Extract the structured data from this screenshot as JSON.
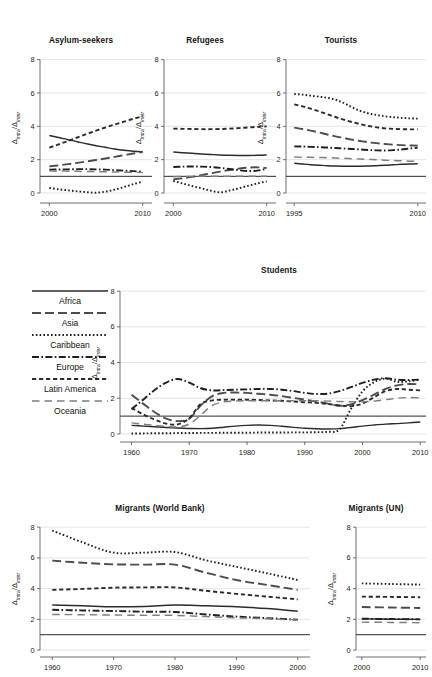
{
  "figure": {
    "yaxis_label_main": "Δ",
    "yaxis_label_sub1": "intra",
    "yaxis_label_div": "/Δ",
    "yaxis_label_sub2": "inter"
  },
  "legend": {
    "title": "",
    "items": [
      {
        "label": "Africa",
        "style": "solid",
        "key": "africa"
      },
      {
        "label": "Asia",
        "style": "longdash",
        "key": "asia"
      },
      {
        "label": "Caribbean",
        "style": "dotted",
        "key": "caribbean"
      },
      {
        "label": "Europe",
        "style": "dashdot",
        "key": "europe"
      },
      {
        "label": "Latin America",
        "style": "shortdash",
        "key": "latin_america"
      },
      {
        "label": "Oceania",
        "style": "dashlong",
        "key": "oceania"
      }
    ]
  },
  "chart_data": [
    {
      "id": "asylum-seekers",
      "type": "line",
      "title": "Asylum-seekers",
      "xlabel": "",
      "ylabel": "Δintra/Δinter",
      "xlim": [
        1999,
        2011
      ],
      "ylim": [
        -0.6,
        8.4
      ],
      "yticks": [
        0,
        2,
        4,
        6,
        8
      ],
      "xticks": [
        2000,
        2010
      ],
      "grid": true,
      "reference_line": 1,
      "x": [
        2000,
        2001,
        2002,
        2003,
        2004,
        2005,
        2006,
        2007,
        2008,
        2009,
        2010
      ],
      "series": [
        {
          "name": "Africa",
          "style": "solid",
          "values": [
            3.45,
            3.33,
            3.2,
            3.08,
            2.95,
            2.84,
            2.74,
            2.64,
            2.56,
            2.5,
            2.47
          ]
        },
        {
          "name": "Asia",
          "style": "longdash",
          "values": [
            1.6,
            1.66,
            1.73,
            1.81,
            1.89,
            1.98,
            2.07,
            2.17,
            2.27,
            2.37,
            2.45
          ]
        },
        {
          "name": "Caribbean",
          "style": "dotted",
          "values": [
            0.3,
            0.22,
            0.16,
            0.1,
            0.05,
            0.02,
            0.08,
            0.2,
            0.36,
            0.53,
            0.68
          ]
        },
        {
          "name": "Europe",
          "style": "dashdot",
          "values": [
            1.4,
            1.41,
            1.42,
            1.43,
            1.43,
            1.42,
            1.4,
            1.37,
            1.34,
            1.31,
            1.28
          ]
        },
        {
          "name": "Latin America",
          "style": "shortdash",
          "values": [
            2.72,
            2.92,
            3.12,
            3.33,
            3.54,
            3.74,
            3.93,
            4.11,
            4.28,
            4.45,
            4.6
          ]
        },
        {
          "name": "Oceania",
          "style": "dashlong",
          "values": [
            1.32,
            1.32,
            1.31,
            1.3,
            1.29,
            1.28,
            1.27,
            1.26,
            1.25,
            1.24,
            1.23
          ]
        }
      ]
    },
    {
      "id": "refugees",
      "type": "line",
      "title": "Refugees",
      "xlabel": "",
      "ylabel": "Δintra/Δinter",
      "xlim": [
        1999,
        2011
      ],
      "ylim": [
        -0.6,
        8.4
      ],
      "yticks": [
        0,
        2,
        4,
        6,
        8
      ],
      "xticks": [
        2000,
        2010
      ],
      "grid": true,
      "reference_line": 1,
      "x": [
        2000,
        2001,
        2002,
        2003,
        2004,
        2005,
        2006,
        2007,
        2008,
        2009,
        2010
      ],
      "series": [
        {
          "name": "Africa",
          "style": "solid",
          "values": [
            2.46,
            2.42,
            2.38,
            2.34,
            2.31,
            2.28,
            2.26,
            2.25,
            2.25,
            2.26,
            2.28
          ]
        },
        {
          "name": "Asia",
          "style": "longdash",
          "values": [
            0.82,
            0.88,
            0.97,
            1.07,
            1.18,
            1.28,
            1.38,
            1.46,
            1.52,
            1.54,
            1.5
          ]
        },
        {
          "name": "Caribbean",
          "style": "dotted",
          "values": [
            0.72,
            0.57,
            0.42,
            0.28,
            0.14,
            0.04,
            0.14,
            0.28,
            0.43,
            0.57,
            0.7
          ]
        },
        {
          "name": "Europe",
          "style": "dashdot",
          "values": [
            1.56,
            1.58,
            1.59,
            1.58,
            1.56,
            1.51,
            1.44,
            1.37,
            1.32,
            1.34,
            1.45
          ]
        },
        {
          "name": "Latin America",
          "style": "shortdash",
          "values": [
            3.86,
            3.85,
            3.84,
            3.83,
            3.83,
            3.84,
            3.86,
            3.89,
            3.93,
            3.97,
            4.0
          ]
        },
        {
          "name": "Oceania",
          "style": "dashlong",
          "values": [
            0.98,
            0.99,
            0.99,
            1.0,
            1.0,
            1.0,
            1.0,
            1.0,
            1.01,
            1.01,
            1.01
          ]
        }
      ]
    },
    {
      "id": "tourists",
      "type": "line",
      "title": "Tourists",
      "xlabel": "",
      "ylabel": "Δintra/Δinter",
      "xlim": [
        1994,
        2011
      ],
      "ylim": [
        -0.6,
        8.4
      ],
      "yticks": [
        0,
        2,
        4,
        6,
        8
      ],
      "xticks": [
        1995,
        2010
      ],
      "grid": true,
      "reference_line": 1,
      "x": [
        1995,
        1996,
        1997,
        1998,
        1999,
        2000,
        2001,
        2002,
        2003,
        2004,
        2005,
        2006,
        2007,
        2008,
        2009,
        2010
      ],
      "series": [
        {
          "name": "Africa",
          "style": "solid",
          "values": [
            1.78,
            1.74,
            1.7,
            1.67,
            1.64,
            1.62,
            1.61,
            1.61,
            1.61,
            1.62,
            1.64,
            1.66,
            1.69,
            1.72,
            1.74,
            1.75
          ]
        },
        {
          "name": "Asia",
          "style": "longdash",
          "values": [
            3.92,
            3.84,
            3.74,
            3.63,
            3.51,
            3.4,
            3.3,
            3.2,
            3.12,
            3.05,
            2.99,
            2.94,
            2.9,
            2.87,
            2.85,
            2.84
          ]
        },
        {
          "name": "Caribbean",
          "style": "dotted",
          "values": [
            5.94,
            5.9,
            5.84,
            5.78,
            5.71,
            5.6,
            5.4,
            5.15,
            4.93,
            4.78,
            4.68,
            4.6,
            4.55,
            4.51,
            4.48,
            4.46
          ]
        },
        {
          "name": "Europe",
          "style": "dashdot",
          "values": [
            2.8,
            2.79,
            2.77,
            2.75,
            2.73,
            2.7,
            2.67,
            2.64,
            2.61,
            2.58,
            2.56,
            2.55,
            2.57,
            2.61,
            2.67,
            2.72
          ]
        },
        {
          "name": "Latin America",
          "style": "shortdash",
          "values": [
            5.32,
            5.2,
            5.06,
            4.9,
            4.73,
            4.56,
            4.4,
            4.26,
            4.13,
            4.02,
            3.94,
            3.88,
            3.85,
            3.83,
            3.82,
            3.82
          ]
        },
        {
          "name": "Oceania",
          "style": "dashlong",
          "values": [
            2.16,
            2.15,
            2.14,
            2.13,
            2.12,
            2.1,
            2.08,
            2.06,
            2.04,
            2.02,
            2.0,
            1.97,
            1.95,
            1.93,
            1.91,
            1.9
          ]
        }
      ]
    },
    {
      "id": "students",
      "type": "line",
      "title": "Students",
      "xlabel": "",
      "ylabel": "Δintra/Δinter",
      "xlim": [
        1958,
        2011
      ],
      "ylim": [
        -0.45,
        8.4
      ],
      "yticks": [
        0,
        2,
        4,
        6,
        8
      ],
      "xticks": [
        1960,
        1970,
        1980,
        1990,
        2000,
        2010
      ],
      "grid": true,
      "reference_line": 1,
      "x": [
        1960,
        1962,
        1964,
        1966,
        1968,
        1970,
        1972,
        1974,
        1976,
        1978,
        1980,
        1982,
        1984,
        1986,
        1988,
        1990,
        1992,
        1994,
        1996,
        1998,
        2000,
        2002,
        2004,
        2006,
        2008,
        2010
      ],
      "series": [
        {
          "name": "Africa",
          "style": "solid",
          "values": [
            0.48,
            0.44,
            0.4,
            0.36,
            0.33,
            0.31,
            0.3,
            0.32,
            0.38,
            0.44,
            0.48,
            0.5,
            0.48,
            0.43,
            0.37,
            0.32,
            0.29,
            0.28,
            0.3,
            0.36,
            0.44,
            0.5,
            0.55,
            0.58,
            0.62,
            0.67
          ]
        },
        {
          "name": "Asia",
          "style": "longdash",
          "values": [
            2.2,
            1.7,
            1.22,
            0.86,
            0.72,
            0.85,
            1.6,
            2.12,
            2.3,
            2.32,
            2.3,
            2.25,
            2.2,
            2.12,
            2.02,
            1.92,
            1.82,
            1.7,
            1.58,
            1.66,
            1.9,
            2.2,
            2.52,
            2.72,
            2.8,
            2.78
          ]
        },
        {
          "name": "Caribbean",
          "style": "dotted",
          "values": [
            0.03,
            0.03,
            0.04,
            0.04,
            0.05,
            0.05,
            0.06,
            0.06,
            0.07,
            0.07,
            0.07,
            0.08,
            0.08,
            0.08,
            0.09,
            0.09,
            0.1,
            0.12,
            0.25,
            1.4,
            2.38,
            2.9,
            3.1,
            2.92,
            2.95,
            3.05
          ]
        },
        {
          "name": "Europe",
          "style": "dashdot",
          "values": [
            1.38,
            1.92,
            2.46,
            2.88,
            3.08,
            2.88,
            2.56,
            2.44,
            2.46,
            2.48,
            2.5,
            2.52,
            2.52,
            2.48,
            2.4,
            2.3,
            2.24,
            2.26,
            2.4,
            2.62,
            2.86,
            3.04,
            3.12,
            3.04,
            3.02,
            3.05
          ]
        },
        {
          "name": "Latin America",
          "style": "shortdash",
          "values": [
            1.46,
            1.1,
            0.8,
            0.58,
            0.54,
            0.88,
            1.68,
            1.88,
            1.92,
            1.92,
            1.92,
            1.9,
            1.88,
            1.86,
            1.82,
            1.78,
            1.74,
            1.68,
            1.6,
            1.56,
            1.7,
            2.06,
            2.4,
            2.52,
            2.48,
            2.44
          ]
        },
        {
          "name": "Oceania",
          "style": "dashlong",
          "values": [
            0.62,
            0.55,
            0.48,
            0.42,
            0.4,
            0.55,
            1.06,
            1.6,
            1.8,
            1.84,
            1.86,
            1.86,
            1.86,
            1.86,
            1.86,
            1.86,
            1.86,
            1.84,
            1.82,
            1.8,
            1.8,
            1.84,
            1.92,
            2.0,
            2.04,
            2.02
          ]
        }
      ]
    },
    {
      "id": "migrants-world-bank",
      "type": "line",
      "title": "Migrants (World Bank)",
      "xlabel": "",
      "ylabel": "Δintra/Δinter",
      "xlim": [
        1958,
        2002
      ],
      "ylim": [
        -0.45,
        8.4
      ],
      "yticks": [
        0,
        2,
        4,
        6,
        8
      ],
      "xticks": [
        1960,
        1970,
        1980,
        1990,
        2000
      ],
      "grid": true,
      "reference_line": 1,
      "x": [
        1960,
        1965,
        1970,
        1975,
        1980,
        1985,
        1990,
        1995,
        2000
      ],
      "series": [
        {
          "name": "Africa",
          "style": "solid",
          "values": [
            2.94,
            2.88,
            2.82,
            2.84,
            2.93,
            2.88,
            2.82,
            2.7,
            2.53
          ]
        },
        {
          "name": "Asia",
          "style": "longdash",
          "values": [
            5.82,
            5.68,
            5.58,
            5.56,
            5.56,
            5.04,
            4.56,
            4.24,
            3.92
          ]
        },
        {
          "name": "Caribbean",
          "style": "dotted",
          "values": [
            7.78,
            7.0,
            6.34,
            6.34,
            6.38,
            5.85,
            5.42,
            5.0,
            4.56
          ]
        },
        {
          "name": "Europe",
          "style": "dashdot",
          "values": [
            2.62,
            2.58,
            2.54,
            2.5,
            2.48,
            2.32,
            2.18,
            2.08,
            1.98
          ]
        },
        {
          "name": "Latin America",
          "style": "shortdash",
          "values": [
            3.92,
            3.98,
            4.06,
            4.08,
            4.08,
            3.86,
            3.66,
            3.48,
            3.3
          ]
        },
        {
          "name": "Oceania",
          "style": "dashlong",
          "values": [
            2.32,
            2.3,
            2.28,
            2.26,
            2.26,
            2.18,
            2.1,
            2.04,
            1.96
          ]
        }
      ]
    },
    {
      "id": "migrants-un",
      "type": "line",
      "title": "Migrants (UN)",
      "xlabel": "",
      "ylabel": "Δintra/Δinter",
      "xlim": [
        1999,
        2011
      ],
      "ylim": [
        -0.45,
        8.4
      ],
      "yticks": [
        0,
        2,
        4,
        6,
        8
      ],
      "xticks": [
        2000,
        2010
      ],
      "grid": true,
      "reference_line": 1,
      "x": [
        2000,
        2005,
        2010
      ],
      "series": [
        {
          "name": "Africa",
          "style": "solid",
          "values": [
            2.03,
            2.01,
            2.0
          ]
        },
        {
          "name": "Asia",
          "style": "longdash",
          "values": [
            2.8,
            2.77,
            2.74
          ]
        },
        {
          "name": "Caribbean",
          "style": "dotted",
          "values": [
            4.34,
            4.3,
            4.26
          ]
        },
        {
          "name": "Europe",
          "style": "dashdot",
          "values": [
            2.04,
            2.02,
            2.0
          ]
        },
        {
          "name": "Latin America",
          "style": "shortdash",
          "values": [
            3.48,
            3.46,
            3.44
          ]
        },
        {
          "name": "Oceania",
          "style": "dashlong",
          "values": [
            1.82,
            1.8,
            1.78
          ]
        }
      ]
    }
  ]
}
